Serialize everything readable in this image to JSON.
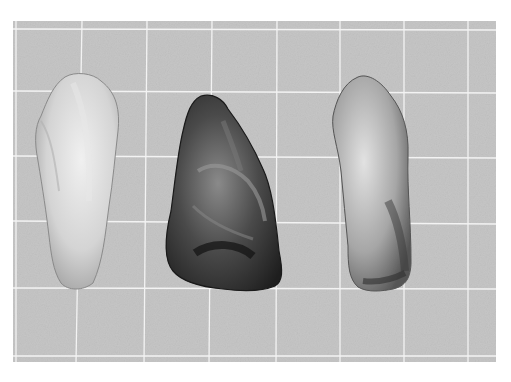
{
  "image": {
    "description": "Black-and-white photograph of three flaked stone tools on a grid background",
    "background_color": "#c9c9c9",
    "grid_color": "#f2f2f2",
    "artifacts": [
      {
        "name": "left-artifact",
        "tone": "light",
        "fill": "#d9d9d9"
      },
      {
        "name": "middle-artifact",
        "tone": "dark",
        "fill": "#3a3a3a"
      },
      {
        "name": "right-artifact",
        "tone": "mottled",
        "fill": "#a8a8a8"
      }
    ]
  }
}
